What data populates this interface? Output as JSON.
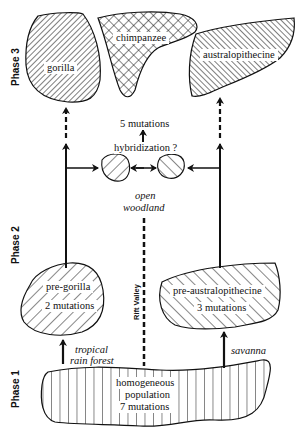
{
  "phases": {
    "phase3": "Phase 3",
    "phase2": "Phase 2",
    "phase1": "Phase 1"
  },
  "nodes": {
    "gorilla": {
      "label": "gorilla"
    },
    "chimpanzee": {
      "label": "chimpanzee"
    },
    "australopithecine": {
      "label": "australopithecine"
    },
    "pre_gorilla": {
      "label": "pre-gorilla",
      "mutations": "2 mutations"
    },
    "pre_australopithecine": {
      "label": "pre-australopithecine",
      "mutations": "3 mutations"
    },
    "homogeneous": {
      "line1": "homogeneous",
      "line2": "population",
      "mutations": "7 mutations"
    }
  },
  "annotations": {
    "five_mutations": "5 mutations",
    "hybridization": "hybridization ?",
    "open_woodland_1": "open",
    "open_woodland_2": "woodland",
    "rift_valley": "Rift Valley",
    "tropical_1": "tropical",
    "tropical_2": "rain forest",
    "savanna": "savanna"
  }
}
